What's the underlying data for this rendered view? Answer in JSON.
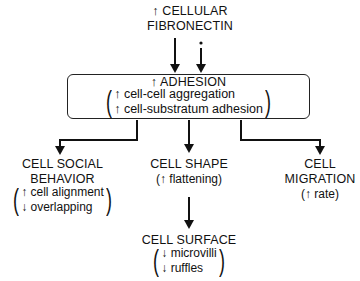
{
  "top": {
    "line1": "↑ CELLULAR",
    "line2": "FIBRONECTIN"
  },
  "adhesion_box": {
    "title": "↑ ADHESION",
    "items": [
      "↑ cell-cell aggregation",
      "↑ cell-substratum adhesion"
    ]
  },
  "social": {
    "title1": "CELL SOCIAL",
    "title2": "BEHAVIOR",
    "items": [
      "↑ cell alignment",
      "↓ overlapping"
    ]
  },
  "shape": {
    "title": "CELL SHAPE",
    "detail": "(↑ flattening)"
  },
  "migration": {
    "title1": "CELL",
    "title2": "MIGRATION",
    "detail": "(↑ rate)"
  },
  "surface": {
    "title": "CELL SURFACE",
    "items": [
      "↓ microvilli",
      "↓ ruffles"
    ]
  },
  "colors": {
    "ink": "#111111",
    "background": "#ffffff"
  }
}
